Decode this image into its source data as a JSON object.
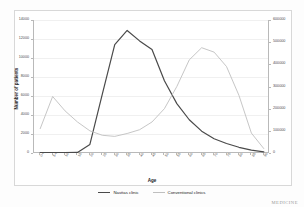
{
  "chart_data": {
    "type": "line",
    "title": "",
    "xlabel": "Age",
    "ylabel": "Number of patients",
    "ylabel_right": "",
    "grid": true,
    "legend_position": "bottom",
    "categories": [
      "0-4",
      "5-9",
      "10-14",
      "15-19",
      "20-24",
      "25-29",
      "30-34",
      "35-39",
      "40-44",
      "45-49",
      "50-54",
      "55-59",
      "60-64",
      "65-69",
      "70-74",
      "75-79",
      "80-84",
      "85-89",
      "90+"
    ],
    "ylim": [
      0,
      14000
    ],
    "yticks": [
      "0",
      "2000",
      "4000",
      "6000",
      "8000",
      "10000",
      "12000",
      "14000"
    ],
    "ylim_right": [
      0,
      600000
    ],
    "yticks_right": [
      "0",
      "100000",
      "200000",
      "300000",
      "400000",
      "500000",
      "600000"
    ],
    "series": [
      {
        "name": "Navitas clinic",
        "axis": "left",
        "color": "#4a4a4a",
        "values": [
          40,
          30,
          30,
          60,
          900,
          6200,
          11400,
          12900,
          11800,
          10900,
          7600,
          5200,
          3500,
          2300,
          1500,
          1000,
          600,
          300,
          120
        ]
      },
      {
        "name": "Conventional clinics",
        "axis": "right",
        "color": "#bfbfbf",
        "values": [
          110000,
          255000,
          190000,
          140000,
          100000,
          80000,
          75000,
          88000,
          105000,
          140000,
          200000,
          300000,
          420000,
          475000,
          455000,
          390000,
          260000,
          90000,
          20000
        ]
      }
    ]
  },
  "legend": {
    "items": [
      {
        "label": "Navitas clinic",
        "color": "#4a4a4a"
      },
      {
        "label": "Conventional clinics",
        "color": "#bfbfbf"
      }
    ]
  },
  "watermark": {
    "text": "MEDICINE"
  }
}
